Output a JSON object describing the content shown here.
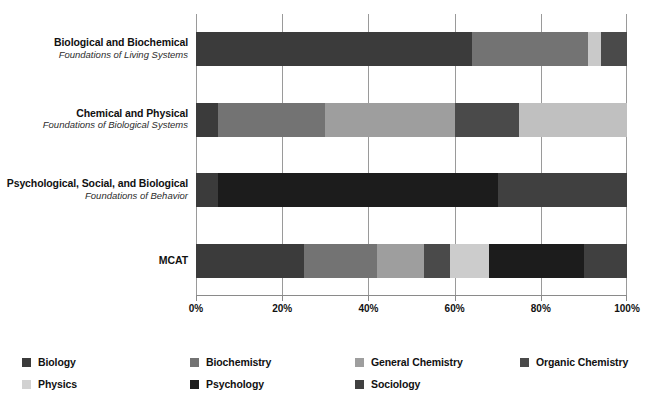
{
  "chart_data": {
    "type": "bar",
    "orientation": "horizontal",
    "stacked": true,
    "normalized_percent": true,
    "title": "",
    "subtitle": "",
    "xlabel": "",
    "ylabel": "",
    "xlim": [
      0,
      100
    ],
    "xticks": [
      "0%",
      "20%",
      "40%",
      "60%",
      "80%",
      "100%"
    ],
    "xtick_values": [
      0,
      20,
      40,
      60,
      80,
      100
    ],
    "grid": true,
    "legend_position": "bottom",
    "categories": [
      {
        "main": "Biological and Biochemical",
        "sub": "Foundations of Living Systems"
      },
      {
        "main": "Chemical and Physical",
        "sub": "Foundations of Biological Systems"
      },
      {
        "main": "Psychological, Social, and Biological",
        "sub": "Foundations of Behavior"
      },
      {
        "main": "MCAT",
        "sub": ""
      }
    ],
    "series": [
      {
        "name": "Biology",
        "color": "#3b3b3b",
        "values": [
          64,
          5,
          5,
          25
        ]
      },
      {
        "name": "Biochemistry",
        "color": "#737373",
        "values": [
          27,
          25,
          0,
          17
        ]
      },
      {
        "name": "General Chemistry",
        "color": "#9e9e9e",
        "values": [
          0,
          30,
          0,
          11
        ]
      },
      {
        "name": "Organic Chemistry",
        "color": "#4a4a4a",
        "values": [
          6,
          15,
          0,
          6
        ]
      },
      {
        "name": "Physics",
        "color": "#c9c9c9",
        "values": [
          3,
          25,
          0,
          9
        ]
      },
      {
        "name": "Psychology",
        "color": "#1c1c1c",
        "values": [
          0,
          0,
          65,
          22
        ]
      },
      {
        "name": "Sociology",
        "color": "#404040",
        "values": [
          0,
          0,
          30,
          10
        ]
      }
    ],
    "bar_stacks": [
      [
        {
          "series": "Biology",
          "value": 64,
          "color": "#3b3b3b"
        },
        {
          "series": "Biochemistry",
          "value": 27,
          "color": "#737373"
        },
        {
          "series": "Physics",
          "value": 3,
          "color": "#c9c9c9"
        },
        {
          "series": "Organic Chemistry",
          "value": 6,
          "color": "#4a4a4a"
        }
      ],
      [
        {
          "series": "Biology",
          "value": 5,
          "color": "#3b3b3b"
        },
        {
          "series": "Biochemistry",
          "value": 25,
          "color": "#737373"
        },
        {
          "series": "General Chemistry",
          "value": 30,
          "color": "#9e9e9e"
        },
        {
          "series": "Organic Chemistry",
          "value": 15,
          "color": "#4a4a4a"
        },
        {
          "series": "Physics",
          "value": 25,
          "color": "#c0c0c0"
        }
      ],
      [
        {
          "series": "Biology",
          "value": 5,
          "color": "#3b3b3b"
        },
        {
          "series": "Psychology",
          "value": 65,
          "color": "#1c1c1c"
        },
        {
          "series": "Sociology",
          "value": 30,
          "color": "#404040"
        }
      ],
      [
        {
          "series": "Biology",
          "value": 25,
          "color": "#3b3b3b"
        },
        {
          "series": "Biochemistry",
          "value": 17,
          "color": "#737373"
        },
        {
          "series": "General Chemistry",
          "value": 11,
          "color": "#9e9e9e"
        },
        {
          "series": "Organic Chemistry",
          "value": 6,
          "color": "#4a4a4a"
        },
        {
          "series": "Physics",
          "value": 9,
          "color": "#cccccc"
        },
        {
          "series": "Psychology",
          "value": 22,
          "color": "#1c1c1c"
        },
        {
          "series": "Sociology",
          "value": 10,
          "color": "#404040"
        }
      ]
    ]
  },
  "legend": {
    "items": [
      {
        "label": "Biology",
        "color": "#3b3b3b"
      },
      {
        "label": "Biochemistry",
        "color": "#737373"
      },
      {
        "label": "General Chemistry",
        "color": "#9e9e9e"
      },
      {
        "label": "Organic Chemistry",
        "color": "#4a4a4a"
      },
      {
        "label": "Physics",
        "color": "#d2d2d2"
      },
      {
        "label": "Psychology",
        "color": "#1c1c1c"
      },
      {
        "label": "Sociology",
        "color": "#404040"
      }
    ]
  }
}
